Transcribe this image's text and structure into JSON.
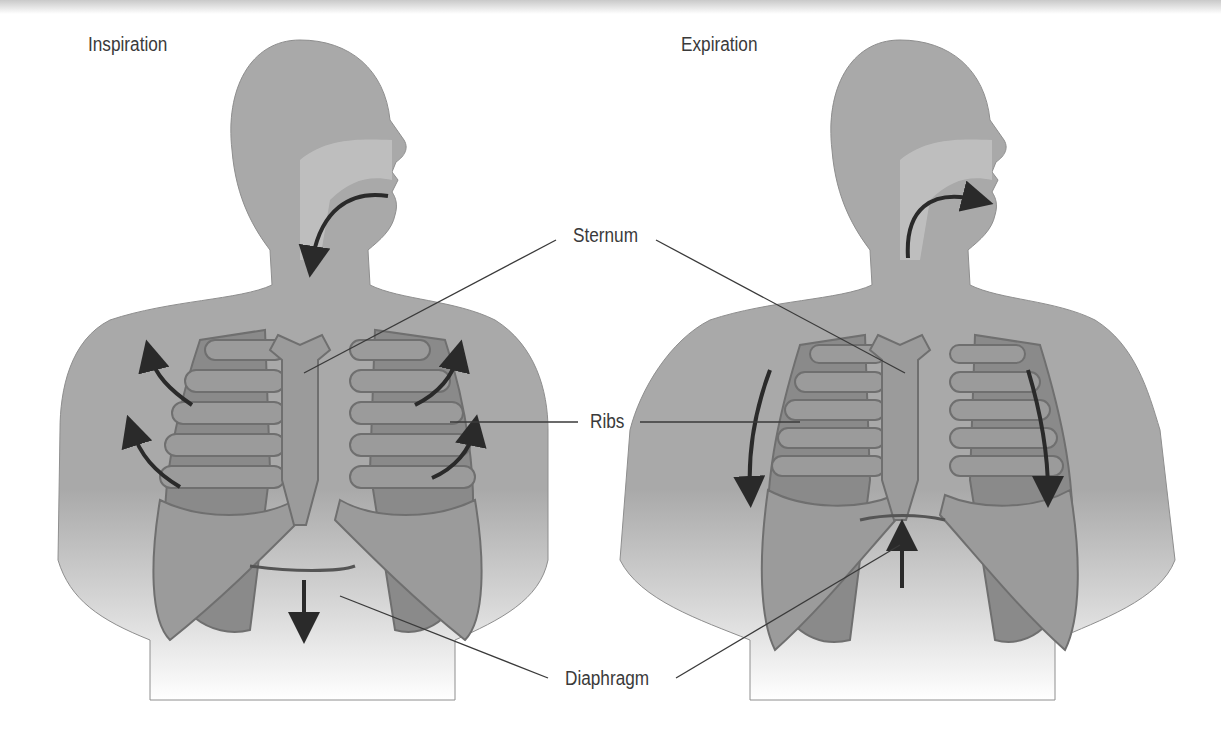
{
  "panels": {
    "left": {
      "title": "Inspiration",
      "diaphragm_arrow": "down",
      "rib_arrows": "outward-up",
      "airflow": "in"
    },
    "right": {
      "title": "Expiration",
      "diaphragm_arrow": "up",
      "rib_arrows": "down",
      "airflow": "out"
    }
  },
  "labels": {
    "sternum": "Sternum",
    "ribs": "Ribs",
    "diaphragm": "Diaphragm"
  },
  "colors": {
    "body": "#a9a9a9",
    "body_outline": "#8e8e8e",
    "ribs": "#9b9b9b",
    "rib_outline": "#6f6f6f",
    "lung": "#8a8a8a",
    "airway": "#c6c6c6",
    "arrow": "#2a2a2a",
    "leader": "#3a3a3a",
    "text": "#3a3a3a"
  }
}
